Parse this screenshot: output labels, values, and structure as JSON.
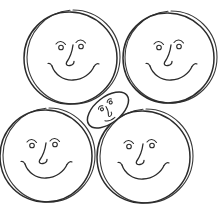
{
  "artwork": {
    "title": "Four Smiling Circle Faces With Small Center Face",
    "style": "hand-drawn black line art on white background",
    "background_color": "#ffffff",
    "ink_color": "#2b2b2b",
    "canvas": {
      "width": 220,
      "height": 209
    }
  },
  "faces": [
    {
      "id": "face-top-left",
      "label": "Top Left Smiling Face",
      "shape": "circle",
      "center_x": 73,
      "center_y": 57,
      "radius": 46,
      "expression": "smiling",
      "features": [
        "left-eye",
        "right-eye",
        "left-eyebrow",
        "right-eyebrow",
        "nose",
        "mouth"
      ]
    },
    {
      "id": "face-top-right",
      "label": "Top Right Smiling Face",
      "shape": "circle",
      "center_x": 171,
      "center_y": 57,
      "radius": 45,
      "expression": "smiling",
      "features": [
        "left-eye",
        "right-eye",
        "left-eyebrow",
        "right-eyebrow",
        "nose",
        "mouth"
      ]
    },
    {
      "id": "face-bottom-left",
      "label": "Bottom Left Smiling Face",
      "shape": "circle",
      "center_x": 49,
      "center_y": 155,
      "radius": 46,
      "expression": "smiling",
      "features": [
        "left-eye",
        "right-eye",
        "left-eyebrow",
        "right-eyebrow",
        "nose",
        "mouth"
      ]
    },
    {
      "id": "face-bottom-right",
      "label": "Bottom Right Smiling Face",
      "shape": "circle",
      "center_x": 146,
      "center_y": 156,
      "radius": 46,
      "expression": "smiling",
      "features": [
        "left-eye",
        "right-eye",
        "left-eyebrow",
        "right-eyebrow",
        "nose",
        "mouth"
      ]
    },
    {
      "id": "face-center-small",
      "label": "Small Squeezed Center Face",
      "shape": "oval",
      "center_x": 108,
      "center_y": 110,
      "radius_x": 24,
      "radius_y": 13,
      "rotation_degrees": -38,
      "expression": "squeezed",
      "features": [
        "left-eye",
        "right-eye",
        "left-eyebrow",
        "right-eyebrow",
        "nose"
      ]
    }
  ],
  "layout": {
    "arrangement": "2x2 grid of circles with one small oval wedged in the middle gap",
    "total_faces": 5
  }
}
